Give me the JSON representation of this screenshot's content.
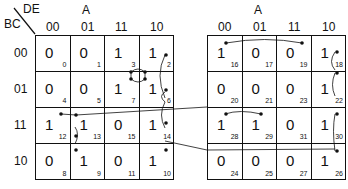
{
  "labels": {
    "row_var": "BC",
    "col_var": "DE",
    "map_var": "A"
  },
  "col_headers": [
    "00",
    "01",
    "11",
    "10"
  ],
  "row_headers": [
    "00",
    "01",
    "11",
    "10"
  ],
  "maps": [
    {
      "a_value": "0",
      "cells": [
        [
          {
            "v": "0",
            "i": "0"
          },
          {
            "v": "0",
            "i": "1"
          },
          {
            "v": "1",
            "i": "3"
          },
          {
            "v": "1",
            "i": "2"
          }
        ],
        [
          {
            "v": "0",
            "i": "4"
          },
          {
            "v": "0",
            "i": "5"
          },
          {
            "v": "1",
            "i": "7"
          },
          {
            "v": "1",
            "i": "6"
          }
        ],
        [
          {
            "v": "1",
            "i": "12"
          },
          {
            "v": "1",
            "i": "13"
          },
          {
            "v": "0",
            "i": "15"
          },
          {
            "v": "1",
            "i": "14"
          }
        ],
        [
          {
            "v": "0",
            "i": "8"
          },
          {
            "v": "1",
            "i": "9"
          },
          {
            "v": "0",
            "i": "11"
          },
          {
            "v": "1",
            "i": "10"
          }
        ]
      ]
    },
    {
      "a_value": "1",
      "cells": [
        [
          {
            "v": "1",
            "i": "16"
          },
          {
            "v": "0",
            "i": "17"
          },
          {
            "v": "0",
            "i": "19"
          },
          {
            "v": "1",
            "i": "18"
          }
        ],
        [
          {
            "v": "0",
            "i": "20"
          },
          {
            "v": "0",
            "i": "21"
          },
          {
            "v": "0",
            "i": "23"
          },
          {
            "v": "1",
            "i": "22"
          }
        ],
        [
          {
            "v": "1",
            "i": "28"
          },
          {
            "v": "1",
            "i": "29"
          },
          {
            "v": "0",
            "i": "31"
          },
          {
            "v": "1",
            "i": "30"
          }
        ],
        [
          {
            "v": "0",
            "i": "24"
          },
          {
            "v": "0",
            "i": "25"
          },
          {
            "v": "0",
            "i": "27"
          },
          {
            "v": "1",
            "i": "26"
          }
        ]
      ]
    }
  ]
}
